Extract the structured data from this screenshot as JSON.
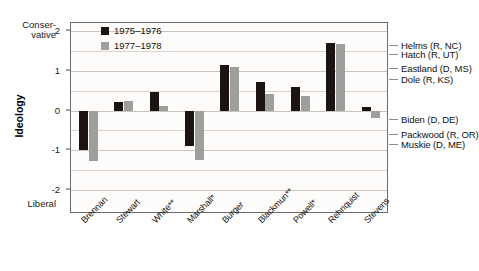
{
  "chart_data": {
    "type": "bar",
    "title": "",
    "xlabel": "",
    "ylabel": "Ideology",
    "ylim": [
      -2.6,
      2.2
    ],
    "grid": true,
    "legend_position": "top-center",
    "axis_top_label": "Conser-\nvative",
    "axis_top_label_line1": "Conser-",
    "axis_top_label_line2": "vative",
    "axis_bottom_label": "Liberal",
    "ytick_values": [
      2,
      1,
      0,
      -1,
      -2
    ],
    "ytick_labels": [
      "2",
      "1",
      "0",
      "-1",
      "-2"
    ],
    "minor_gridlines": [
      1.5,
      0.5,
      -0.5,
      -1.5
    ],
    "categories": [
      "Brennan",
      "Stewart",
      "White**",
      "Marshall*",
      "Burger",
      "Blackmun**",
      "Powell*",
      "Rehnquist",
      "Stevens"
    ],
    "series": [
      {
        "name": "1975–1976",
        "color": "#1c1410",
        "values": [
          -0.98,
          0.22,
          0.47,
          -0.88,
          1.15,
          0.72,
          0.58,
          1.7,
          0.08
        ]
      },
      {
        "name": "1977–1978",
        "color": "#9e9e9c",
        "values": [
          -1.27,
          0.25,
          0.12,
          -1.25,
          1.09,
          0.42,
          0.37,
          1.68,
          -0.18
        ]
      }
    ],
    "reference_markers": [
      {
        "label": "Helms (R, NC)",
        "value": 1.62
      },
      {
        "label": "Hatch (R, UT)",
        "value": 1.4
      },
      {
        "label": "Eastland (D, MS)",
        "value": 1.05
      },
      {
        "label": "Dole (R, KS)",
        "value": 0.78
      },
      {
        "label": "Biden (D, DE)",
        "value": -0.24
      },
      {
        "label": "Packwood (R, OR)",
        "value": -0.62
      },
      {
        "label": "Muskie (D, ME)",
        "value": -0.86
      }
    ]
  }
}
